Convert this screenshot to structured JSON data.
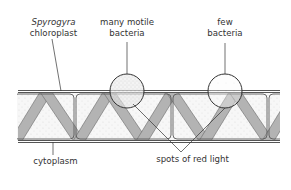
{
  "figure": {
    "labels": {
      "chloroplast_genus": "Spyrogyra",
      "chloroplast_word": "chloroplast",
      "many_line1": "many motile",
      "many_line2": "bacteria",
      "few_line1": "few",
      "few_line2": "bacteria",
      "cytoplasm": "cytoplasm",
      "red_light": "spots of red light"
    },
    "colors": {
      "outline": "#555555",
      "chloroplast_fill": "#b3b3b3",
      "cytoplasm_fill": "#f4f4f4",
      "text": "#333333"
    }
  }
}
